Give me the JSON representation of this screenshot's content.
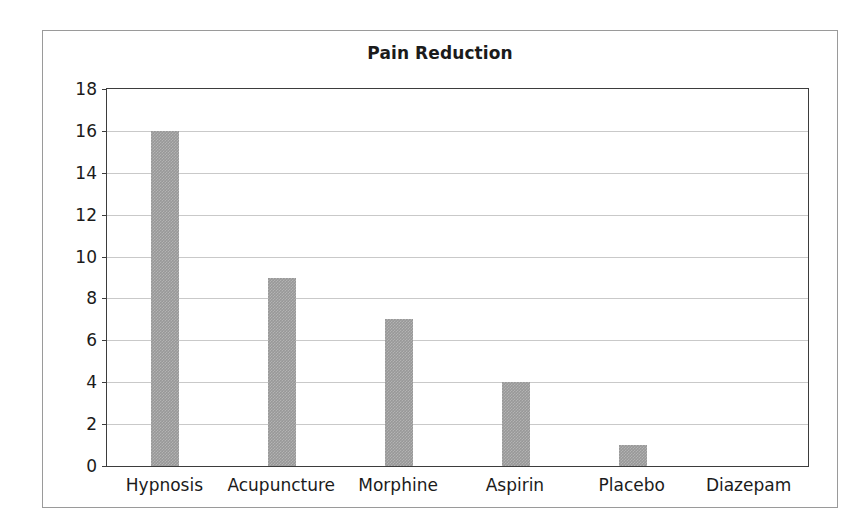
{
  "figure": {
    "background_color": "#ffffff",
    "frame_color": "#9a9a9a",
    "plot_border_color": "#3d3d3d",
    "gridline_color": "#c9c9c9",
    "bar_color": "#989898",
    "text_color": "#1b1b1b"
  },
  "chart_data": {
    "type": "bar",
    "title": "Pain Reduction",
    "subtitle": "",
    "xlabel": "",
    "ylabel": "",
    "categories": [
      "Hypnosis",
      "Acupuncture",
      "Morphine",
      "Aspirin",
      "Placebo",
      "Diazepam"
    ],
    "values": [
      16,
      9,
      7,
      4,
      1,
      0
    ],
    "ylim": [
      0,
      18
    ],
    "ytick_step": 2,
    "yticks": [
      0,
      2,
      4,
      6,
      8,
      10,
      12,
      14,
      16,
      18
    ],
    "ytick_labels": [
      "0",
      "2",
      "4",
      "6",
      "8",
      "10",
      "12",
      "14",
      "16",
      "18"
    ],
    "grid": true,
    "grid_axis": "y",
    "legend": false,
    "legend_position": "none",
    "bar_color": "#989898",
    "series": [
      {
        "name": "Pain Reduction",
        "values": [
          16,
          9,
          7,
          4,
          1,
          0
        ]
      }
    ]
  }
}
